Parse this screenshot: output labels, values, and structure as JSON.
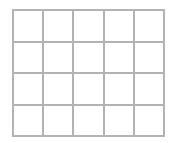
{
  "grid": {
    "columns": 5,
    "rows": 4,
    "line_color": "#b3b3b3",
    "cell_color": "#ffffff",
    "cells": [
      [
        "",
        "",
        "",
        "",
        ""
      ],
      [
        "",
        "",
        "",
        "",
        ""
      ],
      [
        "",
        "",
        "",
        "",
        ""
      ],
      [
        "",
        "",
        "",
        "",
        ""
      ]
    ]
  }
}
